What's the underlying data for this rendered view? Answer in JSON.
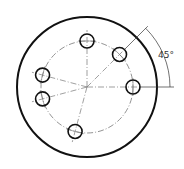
{
  "diagram": {
    "type": "bolt-circle-flange",
    "dimension_label": "45°",
    "outer_circle": {
      "cx": 87,
      "cy": 87,
      "r": 70
    },
    "bolt_circle": {
      "cx": 87,
      "cy": 87,
      "r": 46
    },
    "hole_radius": 7,
    "hole_angles_deg": [
      0,
      45,
      90,
      165,
      195,
      255
    ],
    "colors": {
      "line": "#111111",
      "center_line": "#666666"
    }
  }
}
